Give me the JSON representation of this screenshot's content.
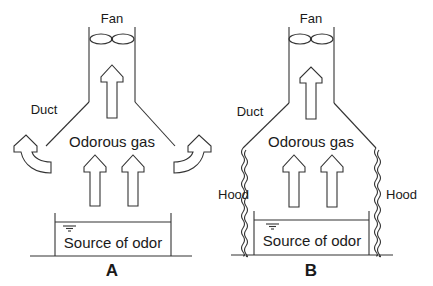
{
  "figure": {
    "panels": [
      {
        "id": "A",
        "panel_label": "A",
        "labels": {
          "fan": "Fan",
          "duct": "Duct",
          "gas": "Odorous gas",
          "source": "Source of odor"
        },
        "has_hood": false,
        "leak_arrows": true
      },
      {
        "id": "B",
        "panel_label": "B",
        "labels": {
          "fan": "Fan",
          "duct": "Duct",
          "gas": "Odorous gas",
          "source": "Source of odor",
          "hood_left": "Hood",
          "hood_right": "Hood"
        },
        "has_hood": true,
        "leak_arrows": false
      }
    ]
  }
}
